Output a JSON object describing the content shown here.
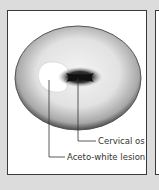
{
  "diagram": {
    "labels": {
      "cervical_os": "Cervical os",
      "lesion": "Aceto-white lesion"
    },
    "colors": {
      "background": "#dcdcdc",
      "panel": "#ffffff",
      "cervix_edge": "#5a5a5a",
      "os": "#1a1a1a",
      "lesion": "#ffffff",
      "leader_line": "#333333"
    }
  }
}
